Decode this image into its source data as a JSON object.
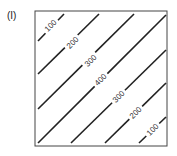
{
  "panel_label": "(I)",
  "diagram": {
    "type": "contour",
    "box": {
      "x": 35,
      "y": 11,
      "w": 132,
      "h": 135
    },
    "contours": [
      {
        "value": "100",
        "x1": 38,
        "y1": 41,
        "x2": 64,
        "y2": 14,
        "lx": 51,
        "ly": 26
      },
      {
        "value": "200",
        "x1": 38,
        "y1": 74,
        "x2": 99,
        "y2": 14,
        "lx": 73,
        "ly": 43
      },
      {
        "value": "300",
        "x1": 38,
        "y1": 109,
        "x2": 134,
        "y2": 14,
        "lx": 91,
        "ly": 61
      },
      {
        "value": "400",
        "x1": 38,
        "y1": 143,
        "x2": 166,
        "y2": 15,
        "lx": 101,
        "ly": 80
      },
      {
        "value": "300",
        "x1": 71,
        "y1": 143,
        "x2": 166,
        "y2": 50,
        "lx": 119,
        "ly": 97
      },
      {
        "value": "200",
        "x1": 105,
        "y1": 143,
        "x2": 166,
        "y2": 83,
        "lx": 136,
        "ly": 113
      },
      {
        "value": "100",
        "x1": 139,
        "y1": 143,
        "x2": 166,
        "y2": 117,
        "lx": 153,
        "ly": 130
      }
    ]
  }
}
